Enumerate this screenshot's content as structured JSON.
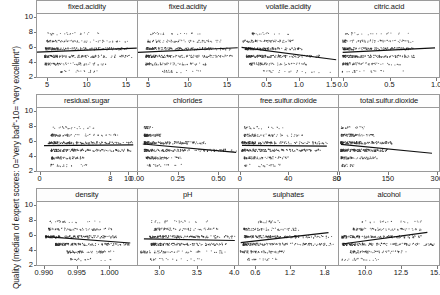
{
  "chart_data": {
    "type": "scatter",
    "title": "",
    "ylabel": "Quality (median of expert scores: 0=\"very bad\"-10= \"very excellent\")",
    "xlabel": "",
    "ylim": [
      2,
      10.6
    ],
    "yticks": [
      2,
      4,
      6,
      8,
      10
    ],
    "grid": false,
    "legend": "none",
    "layout": {
      "rows": 3,
      "cols": 4
    },
    "quality_levels": [
      3,
      4,
      5,
      6,
      7,
      8
    ],
    "panels": [
      {
        "title": "fixed.acidity",
        "xlim": [
          3.6,
          16.4
        ],
        "xticks": [
          5,
          10,
          15
        ],
        "xticklabels": [
          "5",
          "10",
          "15"
        ],
        "trend": {
          "x0": 3.6,
          "y0": 5.56,
          "x1": 16.4,
          "y1": 6.08
        },
        "bands": [
          {
            "quality": 8,
            "x_from": 5.0,
            "x_to": 12.6,
            "density": "sparse"
          },
          {
            "quality": 7,
            "x_from": 4.9,
            "x_to": 15.6,
            "density": "medium"
          },
          {
            "quality": 6,
            "x_from": 4.7,
            "x_to": 15.6,
            "density": "dense"
          },
          {
            "quality": 5,
            "x_from": 4.6,
            "x_to": 15.9,
            "density": "dense"
          },
          {
            "quality": 4,
            "x_from": 4.6,
            "x_to": 12.5,
            "density": "medium"
          },
          {
            "quality": 3,
            "x_from": 6.7,
            "x_to": 11.6,
            "density": "sparse"
          }
        ]
      },
      {
        "title": "fixed.acidity",
        "xlim": [
          3.6,
          16.4
        ],
        "xticks": [
          5,
          10,
          15
        ],
        "xticklabels": [
          "5",
          "10",
          "15"
        ],
        "trend": {
          "x0": 3.6,
          "y0": 5.52,
          "x1": 16.4,
          "y1": 6.14
        },
        "bands": [
          {
            "quality": 8,
            "x_from": 5.2,
            "x_to": 12.0,
            "density": "sparse"
          },
          {
            "quality": 7,
            "x_from": 4.9,
            "x_to": 14.3,
            "density": "medium"
          },
          {
            "quality": 6,
            "x_from": 4.7,
            "x_to": 15.6,
            "density": "dense"
          },
          {
            "quality": 5,
            "x_from": 4.6,
            "x_to": 15.9,
            "density": "dense"
          },
          {
            "quality": 4,
            "x_from": 4.6,
            "x_to": 12.5,
            "density": "medium"
          },
          {
            "quality": 3,
            "x_from": 6.7,
            "x_to": 11.6,
            "density": "sparse"
          }
        ]
      },
      {
        "title": "volatile.acidity",
        "xlim": [
          0.06,
          1.62
        ],
        "xticks": [
          0.5,
          1.0,
          1.5
        ],
        "xticklabels": [
          "0.5",
          "1.0",
          "1.5"
        ],
        "trend": {
          "x0": 0.1,
          "y0": 6.18,
          "x1": 1.58,
          "y1": 4.55
        },
        "bands": [
          {
            "quality": 8,
            "x_from": 0.26,
            "x_to": 0.85,
            "density": "sparse"
          },
          {
            "quality": 7,
            "x_from": 0.12,
            "x_to": 0.92,
            "density": "medium"
          },
          {
            "quality": 6,
            "x_from": 0.16,
            "x_to": 1.04,
            "density": "dense"
          },
          {
            "quality": 5,
            "x_from": 0.18,
            "x_to": 1.33,
            "density": "dense"
          },
          {
            "quality": 4,
            "x_from": 0.23,
            "x_to": 1.13,
            "density": "medium"
          },
          {
            "quality": 3,
            "x_from": 0.44,
            "x_to": 1.58,
            "density": "sparse"
          }
        ]
      },
      {
        "title": "citric.acid",
        "xlim": [
          -0.04,
          1.04
        ],
        "xticks": [
          0.0,
          0.5,
          1.0
        ],
        "xticklabels": [
          "0.0",
          "0.5",
          "1.0"
        ],
        "trend": {
          "x0": 0.0,
          "y0": 5.52,
          "x1": 1.0,
          "y1": 6.12
        },
        "bands": [
          {
            "quality": 8,
            "x_from": 0.03,
            "x_to": 0.72,
            "density": "sparse"
          },
          {
            "quality": 7,
            "x_from": 0.0,
            "x_to": 0.76,
            "density": "medium"
          },
          {
            "quality": 6,
            "x_from": 0.0,
            "x_to": 0.78,
            "density": "dense"
          },
          {
            "quality": 5,
            "x_from": 0.0,
            "x_to": 0.79,
            "density": "dense"
          },
          {
            "quality": 4,
            "x_from": 0.0,
            "x_to": 0.66,
            "density": "medium"
          },
          {
            "quality": 3,
            "x_from": 0.0,
            "x_to": 0.66,
            "density": "sparse"
          }
        ]
      },
      {
        "title": "residual.sugar",
        "xlim": [
          -0.4,
          11.0
        ],
        "xticks": [
          0,
          8,
          10
        ],
        "xticklabels": [
          "0",
          "8",
          "10"
        ],
        "trend": {
          "x0": 0.4,
          "y0": 5.62,
          "x1": 10.6,
          "y1": 5.72
        },
        "bands": [
          {
            "quality": 8,
            "x_from": 1.4,
            "x_to": 6.4,
            "density": "sparse"
          },
          {
            "quality": 7,
            "x_from": 1.2,
            "x_to": 8.9,
            "density": "medium"
          },
          {
            "quality": 6,
            "x_from": 0.9,
            "x_to": 10.7,
            "density": "dense"
          },
          {
            "quality": 5,
            "x_from": 1.2,
            "x_to": 10.3,
            "density": "dense"
          },
          {
            "quality": 4,
            "x_from": 1.3,
            "x_to": 5.0,
            "density": "medium"
          },
          {
            "quality": 3,
            "x_from": 1.2,
            "x_to": 5.7,
            "density": "sparse"
          }
        ]
      },
      {
        "title": "chlorides",
        "xlim": [
          0.0,
          0.62
        ],
        "xticks": [
          0.0,
          0.25,
          0.5
        ],
        "xticklabels": [
          "0.00",
          "0.25",
          "0.50"
        ],
        "trend": {
          "x0": 0.03,
          "y0": 5.83,
          "x1": 0.61,
          "y1": 4.72
        },
        "bands": [
          {
            "quality": 8,
            "x_from": 0.04,
            "x_to": 0.09,
            "density": "sparse"
          },
          {
            "quality": 7,
            "x_from": 0.04,
            "x_to": 0.14,
            "density": "medium"
          },
          {
            "quality": 6,
            "x_from": 0.04,
            "x_to": 0.42,
            "density": "dense"
          },
          {
            "quality": 5,
            "x_from": 0.04,
            "x_to": 0.61,
            "density": "dense"
          },
          {
            "quality": 4,
            "x_from": 0.05,
            "x_to": 0.27,
            "density": "medium"
          },
          {
            "quality": 3,
            "x_from": 0.06,
            "x_to": 0.27,
            "density": "sparse"
          }
        ]
      },
      {
        "title": "free.sulfur.dioxide",
        "xlim": [
          -1.5,
          82
        ],
        "xticks": [
          0,
          40,
          80
        ],
        "xticklabels": [
          "0",
          "40",
          "80"
        ],
        "trend": {
          "x0": 1,
          "y0": 5.65,
          "x1": 72,
          "y1": 5.55
        },
        "bands": [
          {
            "quality": 8,
            "x_from": 3,
            "x_to": 42,
            "density": "sparse"
          },
          {
            "quality": 7,
            "x_from": 3,
            "x_to": 54,
            "density": "medium"
          },
          {
            "quality": 6,
            "x_from": 1,
            "x_to": 72,
            "density": "dense"
          },
          {
            "quality": 5,
            "x_from": 1,
            "x_to": 68,
            "density": "dense"
          },
          {
            "quality": 4,
            "x_from": 3,
            "x_to": 41,
            "density": "medium"
          },
          {
            "quality": 3,
            "x_from": 3,
            "x_to": 34,
            "density": "sparse"
          }
        ]
      },
      {
        "title": "total.sulfur.dioxide",
        "xlim": [
          0,
          310
        ],
        "xticks": [
          0,
          150,
          300
        ],
        "xticklabels": [
          "0",
          "150",
          "300"
        ],
        "trend": {
          "x0": 6,
          "y0": 5.78,
          "x1": 289,
          "y1": 4.62
        },
        "bands": [
          {
            "quality": 8,
            "x_from": 7,
            "x_to": 88,
            "density": "sparse"
          },
          {
            "quality": 7,
            "x_from": 7,
            "x_to": 110,
            "density": "medium"
          },
          {
            "quality": 6,
            "x_from": 6,
            "x_to": 165,
            "density": "dense"
          },
          {
            "quality": 5,
            "x_from": 6,
            "x_to": 155,
            "density": "dense"
          },
          {
            "quality": 4,
            "x_from": 7,
            "x_to": 119,
            "density": "medium"
          },
          {
            "quality": 3,
            "x_from": 9,
            "x_to": 49,
            "density": "sparse"
          }
        ]
      },
      {
        "title": "density",
        "xlim": [
          0.9888,
          1.0042
        ],
        "xticks": [
          0.99,
          0.995,
          1.0
        ],
        "xticklabels": [
          "0.990",
          "0.995",
          "1.000"
        ],
        "trend": {
          "x0": 0.9901,
          "y0": 6.02,
          "x1": 1.0032,
          "y1": 5.18
        },
        "bands": [
          {
            "quality": 8,
            "x_from": 0.9908,
            "x_to": 0.9988,
            "density": "sparse"
          },
          {
            "quality": 7,
            "x_from": 0.9906,
            "x_to": 1.0004,
            "density": "medium"
          },
          {
            "quality": 6,
            "x_from": 0.9901,
            "x_to": 1.001,
            "density": "dense"
          },
          {
            "quality": 5,
            "x_from": 0.9917,
            "x_to": 1.0032,
            "density": "dense"
          },
          {
            "quality": 4,
            "x_from": 0.9934,
            "x_to": 1.001,
            "density": "medium"
          },
          {
            "quality": 3,
            "x_from": 0.994,
            "x_to": 1.0008,
            "density": "sparse"
          }
        ]
      },
      {
        "title": "pH",
        "xlim": [
          2.7,
          4.05
        ],
        "xticks": [
          3.0,
          3.5,
          4.0
        ],
        "xticklabels": [
          "3.0",
          "3.5",
          "4.0"
        ],
        "trend": {
          "x0": 2.78,
          "y0": 5.72,
          "x1": 4.01,
          "y1": 5.5
        },
        "bands": [
          {
            "quality": 8,
            "x_from": 2.88,
            "x_to": 3.72,
            "density": "sparse"
          },
          {
            "quality": 7,
            "x_from": 2.92,
            "x_to": 3.78,
            "density": "medium"
          },
          {
            "quality": 6,
            "x_from": 2.86,
            "x_to": 4.01,
            "density": "dense"
          },
          {
            "quality": 5,
            "x_from": 2.88,
            "x_to": 3.9,
            "density": "dense"
          },
          {
            "quality": 4,
            "x_from": 2.74,
            "x_to": 3.9,
            "density": "medium"
          },
          {
            "quality": 3,
            "x_from": 2.87,
            "x_to": 3.63,
            "density": "sparse"
          }
        ]
      },
      {
        "title": "sulphates",
        "xlim": [
          0.3,
          2.05
        ],
        "xticks": [
          0.6,
          1.2,
          1.8
        ],
        "xticklabels": [
          "0.6",
          "1.2",
          "1.8"
        ],
        "trend": {
          "x0": 0.33,
          "y0": 5.22,
          "x1": 1.87,
          "y1": 6.55
        },
        "bands": [
          {
            "quality": 8,
            "x_from": 0.63,
            "x_to": 1.1,
            "density": "sparse"
          },
          {
            "quality": 7,
            "x_from": 0.39,
            "x_to": 1.36,
            "density": "medium"
          },
          {
            "quality": 6,
            "x_from": 0.4,
            "x_to": 1.95,
            "density": "dense"
          },
          {
            "quality": 5,
            "x_from": 0.37,
            "x_to": 1.98,
            "density": "dense"
          },
          {
            "quality": 4,
            "x_from": 0.33,
            "x_to": 1.13,
            "density": "medium"
          },
          {
            "quality": 3,
            "x_from": 0.45,
            "x_to": 1.0,
            "density": "sparse"
          }
        ]
      },
      {
        "title": "alcohol",
        "xlim": [
          8.2,
          15.2
        ],
        "xticks": [
          10.0,
          12.5,
          15.0
        ],
        "xticklabels": [
          "10.0",
          "12.5",
          "15.0"
        ],
        "trend": {
          "x0": 8.4,
          "y0": 5.05,
          "x1": 14.4,
          "y1": 6.58
        },
        "bands": [
          {
            "quality": 8,
            "x_from": 9.8,
            "x_to": 14.0,
            "density": "sparse"
          },
          {
            "quality": 7,
            "x_from": 9.2,
            "x_to": 14.0,
            "density": "medium"
          },
          {
            "quality": 6,
            "x_from": 8.4,
            "x_to": 14.0,
            "density": "dense"
          },
          {
            "quality": 5,
            "x_from": 8.5,
            "x_to": 14.9,
            "density": "dense"
          },
          {
            "quality": 4,
            "x_from": 9.0,
            "x_to": 13.1,
            "density": "medium"
          },
          {
            "quality": 3,
            "x_from": 8.4,
            "x_to": 11.0,
            "density": "sparse"
          }
        ]
      }
    ]
  }
}
